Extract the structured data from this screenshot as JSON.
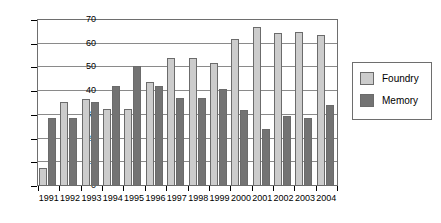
{
  "chart_data": {
    "type": "bar",
    "title": "",
    "xlabel": "",
    "ylabel": "",
    "ylim": [
      0,
      70
    ],
    "ytick_step": 10,
    "yticks": [
      0,
      10,
      20,
      30,
      40,
      50,
      60,
      70
    ],
    "grid": true,
    "legend_position": "right-outside",
    "categories": [
      "1991",
      "1992",
      "1993",
      "1994",
      "1995",
      "1996",
      "1997",
      "1998",
      "1999",
      "2000",
      "2001",
      "2002",
      "2003",
      "2004"
    ],
    "series": [
      {
        "name": "Foundry",
        "color": "#cccccc",
        "values": [
          7.5,
          35.5,
          36.5,
          32.5,
          32.5,
          44,
          54,
          54,
          52,
          62,
          67,
          64.5,
          65,
          63.5
        ]
      },
      {
        "name": "Memory",
        "color": "#737373",
        "values": [
          28.5,
          28.5,
          35.5,
          42,
          50.5,
          42,
          37,
          37,
          41,
          32,
          24,
          29.5,
          28.5,
          34
        ]
      }
    ]
  },
  "legend": {
    "items": [
      {
        "label": "Foundry",
        "swatch": "foundry"
      },
      {
        "label": "Memory",
        "swatch": "memory"
      }
    ]
  }
}
